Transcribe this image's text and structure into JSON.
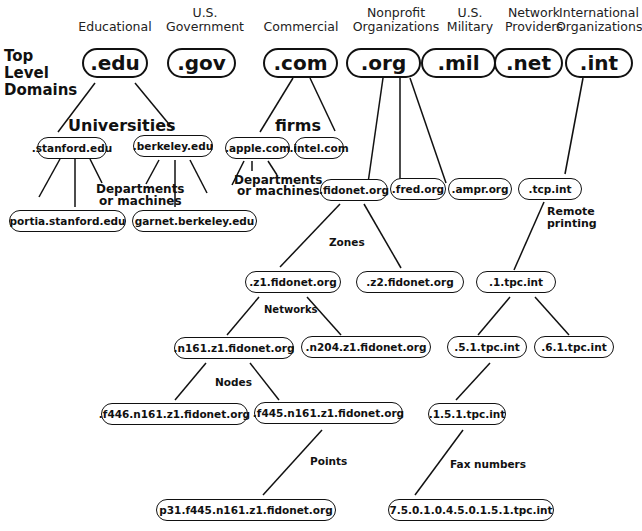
{
  "side_label": [
    "Top",
    "Level",
    "Domains"
  ],
  "categories": [
    {
      "id": "edu",
      "text": "Educational"
    },
    {
      "id": "gov",
      "text": "U.S.\nGovernment"
    },
    {
      "id": "com",
      "text": "Commercial"
    },
    {
      "id": "org",
      "text": "Nonprofit\nOrganizations"
    },
    {
      "id": "mil",
      "text": "U.S.\nMilitary"
    },
    {
      "id": "net",
      "text": "Network\nProviders"
    },
    {
      "id": "int",
      "text": "International\nOrganizations"
    }
  ],
  "tlds": [
    ".edu",
    ".gov",
    ".com",
    ".org",
    ".mil",
    ".net",
    ".int"
  ],
  "nodes": {
    "stanford": ".stanford.edu",
    "berkeley": ".berkeley.edu",
    "apple": ".apple.com",
    "intel": ".intel.com",
    "portia": "portia.stanford.edu",
    "garnet": "garnet.berkeley.edu",
    "fidonet": ".fidonet.org",
    "fred": ".fred.org",
    "ampr": ".ampr.org",
    "tcp": ".tcp.int",
    "z1": ".z1.fidonet.org",
    "z2": ".z2.fidonet.org",
    "tpc1": ".1.tpc.int",
    "n161": ".n161.z1.fidonet.org",
    "n204": ".n204.z1.fidonet.org",
    "tpc51": ".5.1.tpc.int",
    "tpc61": ".6.1.tpc.int",
    "f446": ".f446.n161.z1.fidonet.org",
    "f445": ".f445.n161.z1.fidonet.org",
    "tpc151": ".1.5.1.tpc.int",
    "p31": "p31.f445.n161.z1.fidonet.org",
    "fax": "7.5.0.1.0.4.5.0.1.5.1.tpc.int"
  },
  "labels": {
    "universities": "Universities",
    "firms": "firms",
    "dept1": "Departments\nor machines",
    "dept2": "Departments\nor machines",
    "remote": "Remote\nprinting",
    "zones": "Zones",
    "networks": "Networks",
    "nodes": "Nodes",
    "points": "Points",
    "fax": "Fax numbers"
  }
}
